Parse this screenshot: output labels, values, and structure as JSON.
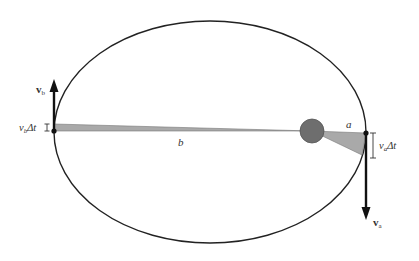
{
  "diagram": {
    "colors": {
      "orbit": "#222222",
      "sun": "#6e6e6e",
      "sector": "#a9a9a9",
      "arrow": "#111111",
      "text": "#333333"
    },
    "labels": {
      "v_b_vector": "v",
      "v_b_sub": "b",
      "v_b_dt": "v",
      "v_b_dt_sub": "b",
      "v_b_dt_suffix": "Δt",
      "b_distance": "b",
      "a_distance": "a",
      "v_a_vector": "v",
      "v_a_sub": "a",
      "v_a_dt": "v",
      "v_a_dt_sub": "a",
      "v_a_dt_suffix": "Δt"
    }
  }
}
